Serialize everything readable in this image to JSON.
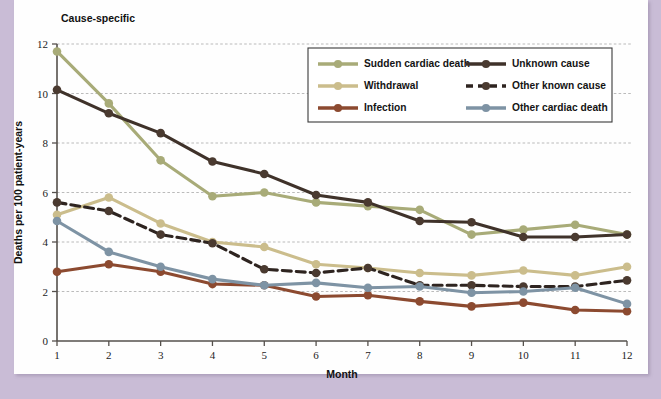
{
  "figure": {
    "title": "Cause-specific",
    "page_background": "#c9bcd6",
    "sheet_background": "#fefefe"
  },
  "chart_data": {
    "type": "line",
    "title": "Cause-specific",
    "xlabel": "Month",
    "ylabel": "Deaths per 100 patient-years",
    "x": [
      1,
      2,
      3,
      4,
      5,
      6,
      7,
      8,
      9,
      10,
      11,
      12
    ],
    "xtick_labels": [
      "1",
      "2",
      "3",
      "4",
      "5",
      "6",
      "7",
      "8",
      "9",
      "10",
      "11",
      "12"
    ],
    "ytick_labels": [
      "0",
      "2",
      "4",
      "6",
      "8",
      "10",
      "12"
    ],
    "yticks": [
      0,
      2,
      4,
      6,
      8,
      10,
      12
    ],
    "xlim": [
      1,
      12
    ],
    "ylim": [
      0,
      12
    ],
    "grid": "horizontal-dotted",
    "legend_position": "upper-right-inside",
    "series": [
      {
        "name": "Sudden cardiac death",
        "color": "#a8ab78",
        "marker_color": "#a8ab78",
        "dash": "solid",
        "values": [
          11.7,
          9.6,
          7.3,
          5.85,
          6.0,
          5.6,
          5.45,
          5.3,
          4.3,
          4.5,
          4.7,
          4.3
        ]
      },
      {
        "name": "Withdrawal",
        "color": "#cbbd8c",
        "marker_color": "#cbbd8c",
        "dash": "solid",
        "values": [
          5.1,
          5.8,
          4.75,
          4.0,
          3.8,
          3.1,
          2.95,
          2.75,
          2.65,
          2.85,
          2.65,
          3.0
        ]
      },
      {
        "name": "Infection",
        "color": "#8c4a30",
        "marker_color": "#8c4a30",
        "dash": "solid",
        "values": [
          2.8,
          3.1,
          2.8,
          2.3,
          2.25,
          1.8,
          1.85,
          1.6,
          1.4,
          1.55,
          1.25,
          1.2
        ]
      },
      {
        "name": "Unknown cause",
        "color": "#3f322a",
        "marker_color": "#4a3a30",
        "dash": "solid",
        "values": [
          10.15,
          9.2,
          8.4,
          7.25,
          6.75,
          5.9,
          5.6,
          4.85,
          4.8,
          4.2,
          4.2,
          4.3
        ]
      },
      {
        "name": "Other known cause",
        "color": "#2e2420",
        "marker_color": "#4a3a30",
        "dash": "dashed",
        "values": [
          5.6,
          5.25,
          4.3,
          3.95,
          2.9,
          2.75,
          2.95,
          2.25,
          2.25,
          2.2,
          2.2,
          2.45
        ]
      },
      {
        "name": "Other cardiac death",
        "color": "#7e93a4",
        "marker_color": "#7e93a4",
        "dash": "solid",
        "values": [
          4.85,
          3.6,
          3.0,
          2.5,
          2.25,
          2.35,
          2.15,
          2.2,
          1.95,
          2.0,
          2.15,
          1.5
        ]
      }
    ],
    "legend_columns": [
      [
        "Sudden cardiac death",
        "Withdrawal",
        "Infection"
      ],
      [
        "Unknown cause",
        "Other known cause",
        "Other cardiac death"
      ]
    ]
  }
}
